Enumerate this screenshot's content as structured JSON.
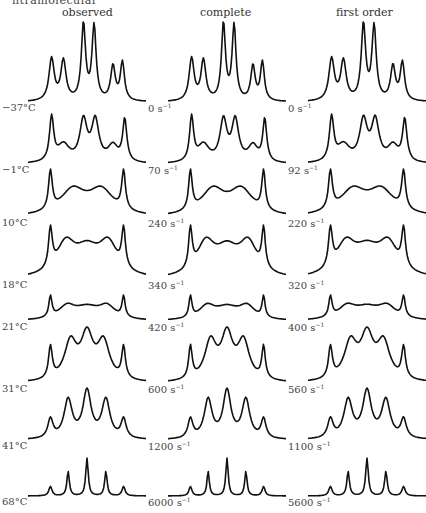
{
  "figure": {
    "top_cutoff_text": "ntramolecular",
    "columns": [
      {
        "header": "observed",
        "header_x": 62
      },
      {
        "header": "complete",
        "header_x": 200
      },
      {
        "header": "first order",
        "header_x": 336
      }
    ]
  },
  "chart_data": {
    "type": "line",
    "columns": [
      "observed",
      "complete",
      "first order"
    ],
    "rows": [
      {
        "observed": "−37°C",
        "complete": "0",
        "first_order": "0",
        "peaks": [
          [
            0.2,
            0.55,
            0.025
          ],
          [
            0.3,
            0.52,
            0.025
          ],
          [
            0.47,
            1.0,
            0.02
          ],
          [
            0.56,
            0.97,
            0.02
          ],
          [
            0.72,
            0.45,
            0.022
          ],
          [
            0.8,
            0.5,
            0.02
          ]
        ]
      },
      {
        "observed": "−1°C",
        "complete": "70",
        "first_order": "92",
        "peaks": [
          [
            0.2,
            0.75,
            0.02
          ],
          [
            0.3,
            0.3,
            0.06
          ],
          [
            0.47,
            0.7,
            0.035
          ],
          [
            0.57,
            0.7,
            0.035
          ],
          [
            0.72,
            0.28,
            0.05
          ],
          [
            0.82,
            0.72,
            0.02
          ]
        ]
      },
      {
        "observed": "10°C",
        "complete": "240",
        "first_order": "220",
        "peaks": [
          [
            0.19,
            0.85,
            0.018
          ],
          [
            0.38,
            0.55,
            0.12
          ],
          [
            0.62,
            0.55,
            0.12
          ],
          [
            0.81,
            0.85,
            0.018
          ]
        ]
      },
      {
        "observed": "18°C",
        "complete": "340",
        "first_order": "320",
        "peaks": [
          [
            0.19,
            0.7,
            0.018
          ],
          [
            0.32,
            0.55,
            0.09
          ],
          [
            0.5,
            0.45,
            0.12
          ],
          [
            0.68,
            0.55,
            0.09
          ],
          [
            0.81,
            0.7,
            0.018
          ]
        ]
      },
      {
        "observed": "21°C",
        "complete": "420",
        "first_order": "400",
        "peaks": [
          [
            0.19,
            0.75,
            0.015
          ],
          [
            0.33,
            0.45,
            0.08
          ],
          [
            0.5,
            0.42,
            0.12
          ],
          [
            0.67,
            0.45,
            0.08
          ],
          [
            0.81,
            0.75,
            0.015
          ]
        ]
      },
      {
        "observed": "31°C",
        "complete": "600",
        "first_order": "560",
        "peaks": [
          [
            0.19,
            0.55,
            0.018
          ],
          [
            0.36,
            0.65,
            0.06
          ],
          [
            0.5,
            0.75,
            0.06
          ],
          [
            0.64,
            0.65,
            0.06
          ],
          [
            0.81,
            0.55,
            0.018
          ]
        ]
      },
      {
        "observed": "41°C",
        "complete": "1200",
        "first_order": "1100",
        "peaks": [
          [
            0.19,
            0.35,
            0.025
          ],
          [
            0.34,
            0.7,
            0.04
          ],
          [
            0.5,
            0.85,
            0.04
          ],
          [
            0.66,
            0.7,
            0.04
          ],
          [
            0.81,
            0.35,
            0.025
          ]
        ]
      },
      {
        "observed": "68°C",
        "complete": "6000",
        "first_order": "5600",
        "peaks": [
          [
            0.19,
            0.25,
            0.015
          ],
          [
            0.34,
            0.65,
            0.012
          ],
          [
            0.5,
            1.0,
            0.012
          ],
          [
            0.66,
            0.65,
            0.012
          ],
          [
            0.81,
            0.25,
            0.015
          ]
        ]
      }
    ],
    "units": {
      "observed": "°C",
      "rate": "s⁻¹"
    }
  },
  "layout": {
    "row_label_y": [
      108,
      170,
      223,
      285,
      327,
      389,
      446,
      502
    ],
    "row_heights": [
      82,
      52,
      50,
      56,
      28,
      58,
      54,
      40
    ],
    "col_x": [
      28,
      168,
      308
    ],
    "label_x": [
      2,
      148,
      288
    ]
  }
}
